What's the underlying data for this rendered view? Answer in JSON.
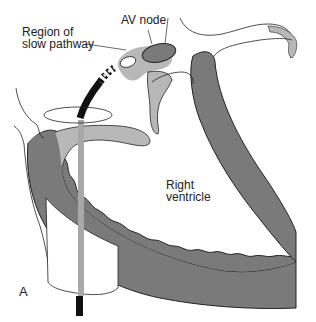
{
  "figure": {
    "panel_label": "A",
    "labels": {
      "region_slow_pathway_line1": "Region of",
      "region_slow_pathway_line2": "slow pathway",
      "av_node": "AV node",
      "right_ventricle_line1": "Right",
      "right_ventricle_line2": "ventricle"
    },
    "colors": {
      "myocardium_dark": "#7a7a7a",
      "tissue_light": "#b8b8b8",
      "catheter": "#111111",
      "outline": "#222222",
      "background": "#ffffff"
    }
  }
}
